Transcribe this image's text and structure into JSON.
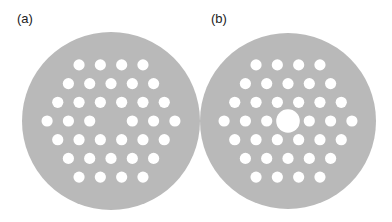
{
  "colors": {
    "background": "#ffffff",
    "plate": "#b9b9b9",
    "hole": "#ffffff",
    "label": "#222222"
  },
  "layout": {
    "hole_radius": 5.6,
    "dx": 21.3,
    "dy": 18.7,
    "row_counts": [
      4,
      5,
      6,
      7,
      6,
      5,
      4
    ]
  },
  "panels": [
    {
      "id": "a",
      "label": "(a)",
      "label_pos": [
        17,
        12
      ],
      "plate": {
        "cx": 111,
        "cy": 121,
        "r": 89
      },
      "center_hole": "none",
      "center_hole_radius": 0
    },
    {
      "id": "b",
      "label": "(b)",
      "label_pos": [
        211,
        12
      ],
      "plate": {
        "cx": 288,
        "cy": 121,
        "r": 88
      },
      "center_hole": "large",
      "center_hole_radius": 11.8
    }
  ]
}
